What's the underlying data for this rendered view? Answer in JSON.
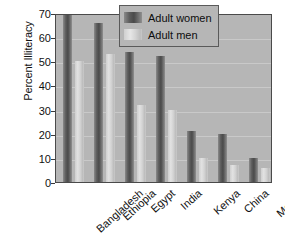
{
  "chart_data": {
    "type": "bar",
    "title": "",
    "xlabel": "",
    "ylabel": "Percent Illiteracy",
    "ylim": [
      0,
      70
    ],
    "yticks": [
      0,
      10,
      20,
      30,
      40,
      50,
      60,
      70
    ],
    "grid": true,
    "legend_position": "top-right",
    "categories": [
      "Bangladesh",
      "Ethiopia",
      "Egypt",
      "India",
      "Kenya",
      "China",
      "Mexico"
    ],
    "series": [
      {
        "name": "Adult women",
        "color": "#5d5d5d",
        "values": [
          69,
          66,
          54,
          52,
          21,
          20,
          10
        ]
      },
      {
        "name": "Adult men",
        "color": "#d2d2d2",
        "values": [
          50,
          53,
          32,
          30,
          10,
          7,
          6
        ]
      }
    ]
  },
  "legend": {
    "items": [
      {
        "label": "Adult women"
      },
      {
        "label": "Adult men"
      }
    ]
  }
}
